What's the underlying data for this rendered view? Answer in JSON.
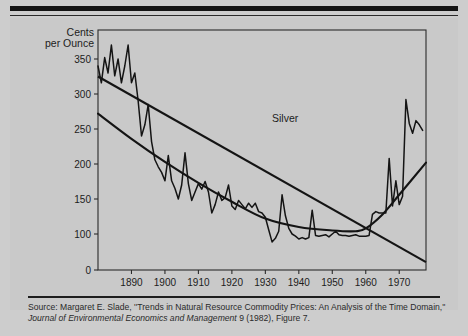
{
  "figure": {
    "series_label": "Silver",
    "source_prefix": "Source: Margaret E. Slade, ''Trends in Natural Resource Commodity Prices: An Analysis of the Time Domain,'' ",
    "source_italic": "Journal of Environmental Economics and Management",
    "source_suffix": " 9 (1982), Figure 7."
  },
  "chart_data": {
    "type": "line",
    "title": "",
    "subtitle": "",
    "xlabel": "",
    "ylabel": "Cents per Ounce",
    "ylabel_line1": "Cents",
    "ylabel_line2": "per Ounce",
    "xlim": [
      1880,
      1978
    ],
    "ylim": [
      0,
      380
    ],
    "grid": false,
    "legend_position": "none",
    "annotations": [
      "Silver"
    ],
    "yticks": [
      0,
      100,
      150,
      200,
      250,
      300,
      350
    ],
    "ytick_labels": [
      "0",
      "100",
      "150",
      "200",
      "250",
      "300",
      "350"
    ],
    "xticks": [
      1890,
      1900,
      1910,
      1920,
      1930,
      1940,
      1950,
      1960,
      1970
    ],
    "xtick_labels": [
      "1890",
      "1900",
      "1910",
      "1920",
      "1930",
      "1940",
      "1950",
      "1960",
      "1970"
    ],
    "axis_note": "y-axis is broken between 0 and 100; tick spacing above 100 is linear at 50-cent intervals",
    "line_color": "#141414",
    "axis_color": "#2b2b2b",
    "background_color": "#c9c9c9",
    "series": [
      {
        "name": "Silver price",
        "style": "jagged annual series",
        "x": [
          1880,
          1881,
          1882,
          1883,
          1884,
          1885,
          1886,
          1887,
          1888,
          1889,
          1890,
          1891,
          1892,
          1893,
          1894,
          1895,
          1896,
          1897,
          1898,
          1899,
          1900,
          1901,
          1902,
          1903,
          1904,
          1905,
          1906,
          1907,
          1908,
          1909,
          1910,
          1911,
          1912,
          1913,
          1914,
          1915,
          1916,
          1917,
          1918,
          1919,
          1920,
          1921,
          1922,
          1923,
          1924,
          1925,
          1926,
          1927,
          1928,
          1929,
          1930,
          1931,
          1932,
          1933,
          1934,
          1935,
          1936,
          1937,
          1938,
          1939,
          1940,
          1941,
          1942,
          1943,
          1944,
          1945,
          1946,
          1947,
          1948,
          1949,
          1950,
          1951,
          1952,
          1953,
          1954,
          1955,
          1956,
          1957,
          1958,
          1959,
          1960,
          1961,
          1962,
          1963,
          1964,
          1965,
          1966,
          1967,
          1968,
          1969,
          1970,
          1971,
          1972,
          1973,
          1974,
          1975,
          1976,
          1977
        ],
        "values": [
          340,
          316,
          352,
          330,
          370,
          326,
          350,
          316,
          340,
          370,
          316,
          330,
          290,
          240,
          256,
          285,
          232,
          206,
          196,
          188,
          176,
          212,
          176,
          165,
          150,
          170,
          216,
          172,
          148,
          160,
          172,
          164,
          175,
          160,
          130,
          142,
          160,
          148,
          152,
          170,
          140,
          135,
          148,
          142,
          136,
          144,
          138,
          144,
          132,
          130,
          124,
          106,
          78,
          88,
          104,
          156,
          126,
          108,
          100,
          94,
          86,
          90,
          86,
          90,
          134,
          96,
          94,
          96,
          98,
          92,
          100,
          104,
          98,
          96,
          96,
          94,
          96,
          98,
          94,
          94,
          94,
          96,
          128,
          132,
          130,
          130,
          130,
          208,
          140,
          176,
          142,
          154,
          292,
          258,
          244,
          262,
          256,
          248
        ]
      },
      {
        "name": "Linear trend",
        "style": "straight declining line",
        "x": [
          1880,
          1978
        ],
        "values": [
          325,
          22
        ]
      },
      {
        "name": "Quadratic / U-shaped trend",
        "style": "smooth curve, minimum near 1957",
        "x": [
          1880,
          1890,
          1900,
          1910,
          1920,
          1930,
          1940,
          1950,
          1957,
          1960,
          1965,
          1970,
          1978
        ],
        "values": [
          272,
          236,
          203,
          173,
          146,
          122,
          110,
          105,
          104,
          108,
          128,
          156,
          202
        ]
      }
    ]
  }
}
